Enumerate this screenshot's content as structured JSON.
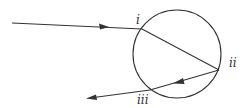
{
  "diagram": {
    "colors": {
      "stroke": "#333333",
      "background": "#ffffff"
    },
    "circle": {
      "cx": 177,
      "cy": 54,
      "r": 44
    },
    "points": {
      "i": {
        "label": "i",
        "x": 142,
        "y": 29
      },
      "ii": {
        "label": "ii",
        "x": 219,
        "y": 70
      },
      "iii": {
        "label": "iii",
        "x": 150,
        "y": 90
      }
    },
    "rays": {
      "incoming": {
        "from": [
          12,
          23
        ],
        "to": [
          142,
          29
        ]
      },
      "internal_refracted": {
        "from": [
          142,
          29
        ],
        "to": [
          219,
          70
        ]
      },
      "internal_reflected": {
        "from": [
          219,
          70
        ],
        "to": [
          150,
          90
        ]
      },
      "outgoing": {
        "from": [
          150,
          90
        ],
        "to": [
          87,
          98
        ]
      }
    }
  }
}
